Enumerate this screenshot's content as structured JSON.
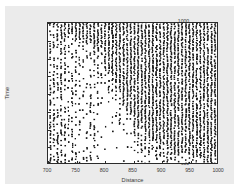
{
  "chart_data": {
    "type": "scatter",
    "title": "",
    "xlabel": "Distance",
    "ylabel": "Time",
    "xlim": [
      700,
      1000
    ],
    "ylim": [
      600,
      1000
    ],
    "xticks": [
      700,
      750,
      800,
      850,
      900,
      950,
      1000
    ],
    "yticks": [
      600,
      650,
      700,
      750,
      800,
      850,
      900,
      950,
      1000
    ],
    "xtick_labels": [
      "700",
      "750",
      "800",
      "850",
      "900",
      "950",
      "1000"
    ],
    "ytick_labels": [
      "600",
      "650",
      "700",
      "750",
      "800",
      "850",
      "900",
      "950",
      "1000"
    ],
    "grid": false,
    "legend": null,
    "marker": {
      "shape": "square",
      "color": "#1a1a1a",
      "size_px": 1.6
    },
    "structure": {
      "column_spacing": 6.5,
      "column_start": 704,
      "row_spacing": 5,
      "row_start": 600,
      "boundary_note": "Points above the line Time = 1000 - 1.45*(Distance-704) are nearly fully filled; below it density decays.",
      "boundary_points": [
        {
          "x": 704,
          "y": 1000
        },
        {
          "x": 760,
          "y": 960
        },
        {
          "x": 800,
          "y": 900
        },
        {
          "x": 820,
          "y": 830
        },
        {
          "x": 840,
          "y": 760
        },
        {
          "x": 860,
          "y": 700
        },
        {
          "x": 890,
          "y": 660
        },
        {
          "x": 930,
          "y": 630
        },
        {
          "x": 1000,
          "y": 600
        }
      ]
    },
    "axes_style": {
      "figure_background": "#ebebeb",
      "plot_background": "#ffffff",
      "frame_color": "#2b2b2b",
      "tick_direction": "out"
    }
  }
}
